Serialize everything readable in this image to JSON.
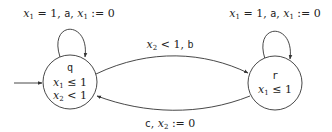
{
  "diagram": {
    "type": "timed-automaton",
    "states": [
      {
        "id": "q",
        "name": "q",
        "initial": true,
        "invariants": [
          "x₁ ≤ 1",
          "x₂ < 1"
        ]
      },
      {
        "id": "r",
        "name": "r",
        "initial": false,
        "invariants": [
          "x₁ ≤ 1"
        ]
      }
    ],
    "transitions": [
      {
        "from": "q",
        "to": "q",
        "label": "x₁ = 1, a, x₁ := 0"
      },
      {
        "from": "r",
        "to": "r",
        "label": "x₁ = 1, a, x₁ := 0"
      },
      {
        "from": "q",
        "to": "r",
        "label": "x₂ < 1, b"
      },
      {
        "from": "r",
        "to": "q",
        "label": "c, x₂ := 0"
      }
    ]
  },
  "labels": {
    "q_name": "q",
    "q_inv1_var": "x",
    "q_inv1_sub": "1",
    "q_inv1_rel": " ≤ 1",
    "q_inv2_var": "x",
    "q_inv2_sub": "2",
    "q_inv2_rel": " < 1",
    "r_name": "r",
    "r_inv1_var": "x",
    "r_inv1_sub": "1",
    "r_inv1_rel": " ≤ 1",
    "q_loop": {
      "x": "x",
      "s1": "1",
      "mid": " = 1, ",
      "act": "a",
      "sep": ", ",
      "x2": "x",
      "s2": "1",
      "end": " := 0"
    },
    "r_loop": {
      "x": "x",
      "s1": "1",
      "mid": " = 1, ",
      "act": "a",
      "sep": ", ",
      "x2": "x",
      "s2": "1",
      "end": " := 0"
    },
    "qr": {
      "x": "x",
      "s": "2",
      "mid": " < 1, ",
      "act": "b"
    },
    "rq": {
      "act": "c",
      "sep": ", ",
      "x": "x",
      "s": "2",
      "end": " := 0"
    }
  }
}
